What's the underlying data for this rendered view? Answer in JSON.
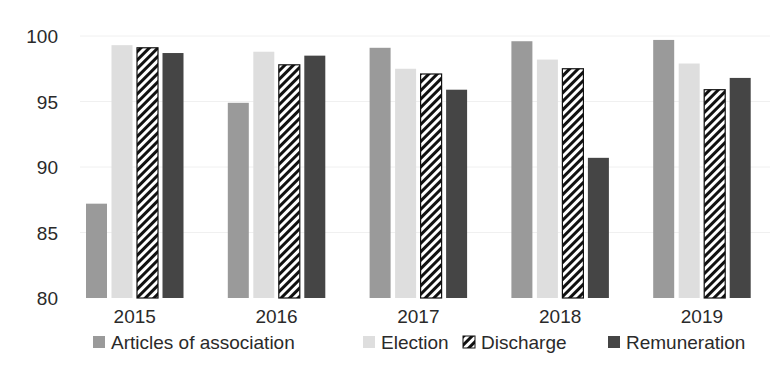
{
  "chart_data": {
    "type": "bar",
    "title": "",
    "xlabel": "",
    "ylabel": "",
    "ylim": [
      80,
      100
    ],
    "yticks": [
      80,
      85,
      90,
      95,
      100
    ],
    "grid": true,
    "legend_position": "bottom",
    "categories": [
      "2015",
      "2016",
      "2017",
      "2018",
      "2019"
    ],
    "series": [
      {
        "name": "Articles of association",
        "color": "#9a9a9a",
        "pattern": "solid",
        "values": [
          87.2,
          94.9,
          99.1,
          99.6,
          99.7
        ]
      },
      {
        "name": "Election",
        "color": "#dedede",
        "pattern": "solid",
        "values": [
          99.3,
          98.8,
          97.5,
          98.2,
          97.9
        ]
      },
      {
        "name": "Discharge",
        "color": "#ffffff",
        "pattern": "diagonal-hatch",
        "values": [
          99.1,
          97.8,
          97.1,
          97.5,
          95.9
        ]
      },
      {
        "name": "Remuneration",
        "color": "#454545",
        "pattern": "solid",
        "values": [
          98.7,
          98.5,
          95.9,
          90.7,
          96.8
        ]
      }
    ]
  }
}
